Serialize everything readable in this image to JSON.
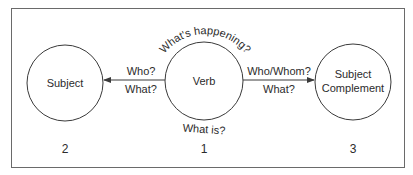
{
  "diagram": {
    "nodes": [
      {
        "id": "subject",
        "label_lines": [
          "Subject"
        ],
        "number": "2"
      },
      {
        "id": "verb",
        "label_lines": [
          "Verb"
        ],
        "number": "1"
      },
      {
        "id": "subject-complement",
        "label_lines": [
          "Subject",
          "Complement"
        ],
        "number": "3"
      }
    ],
    "edges": [
      {
        "from": "verb",
        "to": "subject",
        "label_lines": [
          "Who?",
          "What?"
        ]
      },
      {
        "from": "verb",
        "to": "subject-complement",
        "label_lines": [
          "Who/Whom?",
          "What?"
        ]
      }
    ],
    "annotations": {
      "top_arc": "What's happening?",
      "bottom": "What is?"
    },
    "colors": {
      "stroke": "#3a3a3a",
      "text": "#2b2b2b",
      "frame": "#6a6a6a"
    }
  }
}
